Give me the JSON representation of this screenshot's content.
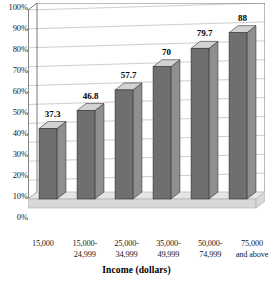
{
  "chart_data": {
    "type": "bar",
    "title": "",
    "subtitle": "",
    "xlabel": "Income (dollars)",
    "ylabel": "",
    "categories": [
      "15,000",
      "15,000-24,999",
      "25,000-34,999",
      "35,000-49,999",
      "50,000-74,999",
      "75,000 and above"
    ],
    "category_lines": [
      [
        "15,000",
        ""
      ],
      [
        "15,000-",
        "24,999"
      ],
      [
        "25,000-",
        "34,999"
      ],
      [
        "35,000-",
        "49,999"
      ],
      [
        "50,000-",
        "74,999"
      ],
      [
        "75,000",
        "and above"
      ]
    ],
    "values": [
      37.3,
      46.8,
      57.7,
      70,
      79.7,
      88
    ],
    "value_labels": [
      "37.3",
      "46.8",
      "57.7",
      "70",
      "79.7",
      "88"
    ],
    "ylim": [
      0,
      100
    ],
    "ytick_values": [
      100,
      90,
      80,
      70,
      60,
      50,
      40,
      30,
      20,
      10,
      0
    ],
    "ytick_labels": [
      "100%",
      "90%",
      "80%",
      "70%",
      "60%",
      "50%",
      "40%",
      "30%",
      "20%",
      "10%",
      "0%"
    ],
    "grid": true,
    "legend": false,
    "legend_position": "none",
    "style": "3d-column",
    "colors": {
      "bar_front": "#6f6f6f",
      "bar_top": "#d3d3d3",
      "bar_side": "#8f8f8f",
      "bar_outline": "#333333",
      "floor": "#d8d8d8",
      "floor_top": "#e6e6e6",
      "floor_edge": "#b5b5b5",
      "gridline": "#b9b9b9",
      "axis": "#555555",
      "background": "#ffffff",
      "text": "#1a1a1a"
    }
  },
  "axis": {
    "x_title": "Income (dollars)"
  }
}
